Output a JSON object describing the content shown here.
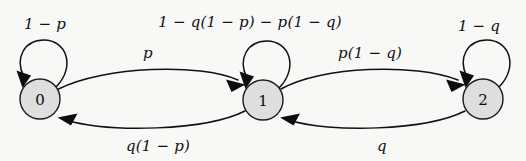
{
  "figure": {
    "type": "markov-chain-state-diagram",
    "background_color": "#f8f8f6",
    "node_fill_color": "#dedede",
    "node_stroke_color": "#1a1a1a",
    "edge_color": "#111111"
  },
  "nodes": [
    {
      "id": "0",
      "label": "0",
      "cx": 40,
      "cy": 99,
      "r": 20
    },
    {
      "id": "1",
      "label": "1",
      "cx": 263,
      "cy": 100,
      "r": 20
    },
    {
      "id": "2",
      "label": "2",
      "cx": 483,
      "cy": 99,
      "r": 20
    }
  ],
  "edges": [
    {
      "name": "self-loop-0",
      "from": "0",
      "to": "0",
      "label": "1 − p",
      "label_x": 45,
      "label_y": 24
    },
    {
      "name": "edge-0-to-1",
      "from": "0",
      "to": "1",
      "label": "p",
      "label_x": 148,
      "label_y": 53
    },
    {
      "name": "edge-1-to-0",
      "from": "1",
      "to": "0",
      "label": "q(1 − p)",
      "label_x": 158,
      "label_y": 146
    },
    {
      "name": "self-loop-1",
      "from": "1",
      "to": "1",
      "label": "1 − q(1 − p) − p(1 − q)",
      "label_x": 250,
      "label_y": 22
    },
    {
      "name": "edge-1-to-2",
      "from": "1",
      "to": "2",
      "label": "p(1 − q)",
      "label_x": 370,
      "label_y": 53
    },
    {
      "name": "edge-2-to-1",
      "from": "2",
      "to": "1",
      "label": "q",
      "label_x": 382,
      "label_y": 146
    },
    {
      "name": "self-loop-2",
      "from": "2",
      "to": "2",
      "label": "1 − q",
      "label_x": 479,
      "label_y": 26
    }
  ]
}
